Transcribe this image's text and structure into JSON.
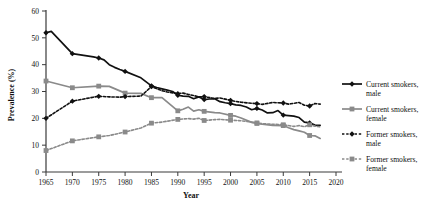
{
  "chart_data": {
    "type": "line",
    "title": "",
    "xlabel": "Year",
    "ylabel": "Prevalence (%)",
    "xlim": [
      1965,
      2020
    ],
    "ylim": [
      0,
      60
    ],
    "xticks": [
      1965,
      1970,
      1975,
      1980,
      1985,
      1990,
      1995,
      2000,
      2005,
      2010,
      2015,
      2020
    ],
    "yticks": [
      0,
      10,
      20,
      30,
      40,
      50,
      60
    ],
    "grid": false,
    "legend_position": "right",
    "series": [
      {
        "name": "Current smokers, male",
        "key": "current_male",
        "color": "#111111",
        "line_style": "solid",
        "marker": "diamond",
        "x": [
          1965,
          1966,
          1970,
          1974,
          1975,
          1976,
          1977,
          1978,
          1979,
          1980,
          1983,
          1985,
          1986,
          1987,
          1988,
          1989,
          1990,
          1991,
          1992,
          1993,
          1994,
          1995,
          1996,
          1997,
          1998,
          1999,
          2000,
          2001,
          2002,
          2003,
          2004,
          2005,
          2006,
          2007,
          2008,
          2009,
          2010,
          2011,
          2012,
          2013,
          2014,
          2015,
          2016,
          2017
        ],
        "y": [
          51.9,
          52.4,
          44.1,
          42.9,
          42.5,
          41.8,
          40.0,
          39.0,
          38.2,
          37.5,
          35.1,
          32.1,
          31.5,
          31.0,
          30.5,
          30.0,
          28.6,
          28.3,
          28.2,
          27.3,
          28.0,
          27.0,
          27.2,
          27.3,
          26.2,
          25.8,
          25.5,
          25.0,
          24.8,
          24.2,
          23.2,
          23.7,
          23.1,
          22.0,
          22.1,
          22.9,
          21.2,
          21.0,
          20.8,
          20.3,
          18.6,
          18.3,
          17.5,
          17.4
        ]
      },
      {
        "name": "Current smokers, female",
        "key": "current_female",
        "color": "#8a8a8a",
        "line_style": "solid",
        "marker": "square",
        "x": [
          1965,
          1970,
          1975,
          1977,
          1980,
          1983,
          1985,
          1987,
          1990,
          1991,
          1992,
          1993,
          1994,
          1995,
          1997,
          1998,
          2000,
          2001,
          2002,
          2004,
          2005,
          2006,
          2008,
          2010,
          2011,
          2012,
          2013,
          2014,
          2015,
          2016,
          2017
        ],
        "y": [
          33.9,
          31.4,
          32.0,
          31.9,
          29.4,
          29.3,
          27.7,
          27.7,
          22.8,
          23.4,
          24.2,
          22.7,
          23.2,
          22.6,
          22.1,
          22.0,
          21.1,
          20.8,
          20.1,
          18.5,
          18.1,
          17.8,
          17.4,
          17.3,
          16.5,
          15.8,
          15.3,
          14.8,
          13.6,
          13.5,
          12.5
        ]
      },
      {
        "name": "Former smokers, male",
        "key": "former_male",
        "color": "#111111",
        "line_style": "dotted",
        "marker": "diamond",
        "x": [
          1965,
          1970,
          1974,
          1975,
          1977,
          1979,
          1980,
          1983,
          1985,
          1987,
          1988,
          1990,
          1991,
          1992,
          1993,
          1994,
          1995,
          1997,
          1998,
          2000,
          2001,
          2002,
          2004,
          2005,
          2006,
          2008,
          2010,
          2011,
          2012,
          2013,
          2014,
          2015,
          2016,
          2017
        ],
        "y": [
          20.0,
          26.4,
          27.9,
          28.2,
          28.0,
          27.9,
          28.1,
          28.3,
          31.8,
          30.3,
          29.8,
          29.2,
          29.4,
          28.9,
          28.5,
          28.0,
          28.1,
          27.4,
          27.6,
          26.7,
          26.3,
          26.0,
          25.6,
          25.5,
          25.2,
          25.9,
          25.7,
          25.3,
          25.6,
          25.9,
          24.9,
          24.6,
          25.5,
          25.3
        ]
      },
      {
        "name": "Former smokers, female",
        "key": "former_female",
        "color": "#8a8a8a",
        "line_style": "dotted",
        "marker": "square",
        "x": [
          1965,
          1970,
          1975,
          1977,
          1980,
          1983,
          1985,
          1987,
          1990,
          1992,
          1993,
          1994,
          1995,
          1997,
          1998,
          2000,
          2002,
          2004,
          2005,
          2006,
          2008,
          2010,
          2012,
          2013,
          2014,
          2015,
          2016,
          2017
        ],
        "y": [
          8.0,
          11.6,
          13.1,
          13.6,
          14.9,
          16.4,
          18.2,
          18.6,
          19.6,
          19.9,
          19.7,
          20.0,
          19.2,
          19.5,
          19.6,
          19.3,
          19.1,
          18.6,
          18.3,
          18.0,
          17.8,
          17.6,
          17.0,
          17.3,
          16.9,
          17.6,
          17.1,
          16.8
        ]
      }
    ]
  },
  "legend": {
    "items": [
      {
        "label_line1": "Current smokers,",
        "label_line2": "male"
      },
      {
        "label_line1": "Current smokers,",
        "label_line2": "female"
      },
      {
        "label_line1": "Former smokers,",
        "label_line2": "male"
      },
      {
        "label_line1": "Former smokers,",
        "label_line2": "female"
      }
    ]
  },
  "colors": {
    "male": "#111111",
    "female": "#8a8a8a",
    "axis": "#3a3a3a",
    "background": "#ffffff"
  }
}
